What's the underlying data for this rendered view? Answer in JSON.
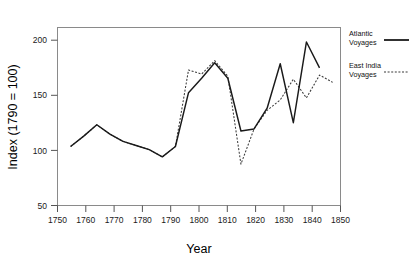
{
  "chart_data": {
    "type": "line",
    "title": "",
    "xlabel": "Year",
    "ylabel": "Index (1790 = 100)",
    "xlim": [
      1745,
      1853
    ],
    "ylim": [
      43,
      215
    ],
    "grid": false,
    "legend_position": "right",
    "xticks": [
      1750,
      1760,
      1770,
      1780,
      1790,
      1800,
      1810,
      1820,
      1830,
      1840,
      1850
    ],
    "yticks": [
      50,
      100,
      150,
      200
    ],
    "x": [
      1750,
      1755,
      1760,
      1765,
      1770,
      1775,
      1780,
      1785,
      1790,
      1795,
      1800,
      1805,
      1810,
      1815,
      1820,
      1825,
      1830,
      1835,
      1840,
      1845,
      1850
    ],
    "series": [
      {
        "name": "Atlantic Voyages",
        "style": "solid",
        "color": "#1a1a1a",
        "values": [
          100,
          110,
          121,
          112,
          105,
          101,
          97,
          90,
          100,
          152,
          166,
          181,
          166,
          115,
          117,
          137,
          180,
          123,
          201,
          176,
          null
        ]
      },
      {
        "name": "East India Voyages",
        "style": "dotted",
        "color": "#3a3a3a",
        "values": [
          100,
          110,
          121,
          112,
          105,
          101,
          97,
          90,
          100,
          174,
          170,
          183,
          168,
          83,
          117,
          135,
          145,
          165,
          147,
          169,
          162
        ]
      }
    ]
  },
  "axes": {
    "x_title": "Year",
    "y_title": "Index (1790 = 100)",
    "x_tick_labels": [
      "1750",
      "1760",
      "1770",
      "1780",
      "1790",
      "1800",
      "1810",
      "1820",
      "1830",
      "1840",
      "1850"
    ],
    "y_tick_labels": [
      "50",
      "100",
      "150",
      "200"
    ]
  },
  "legend": {
    "entries": [
      {
        "line1": "Atlantic",
        "line2": "Voyages",
        "style": "solid"
      },
      {
        "line1": "East India",
        "line2": "Voyages",
        "style": "dotted"
      }
    ]
  }
}
